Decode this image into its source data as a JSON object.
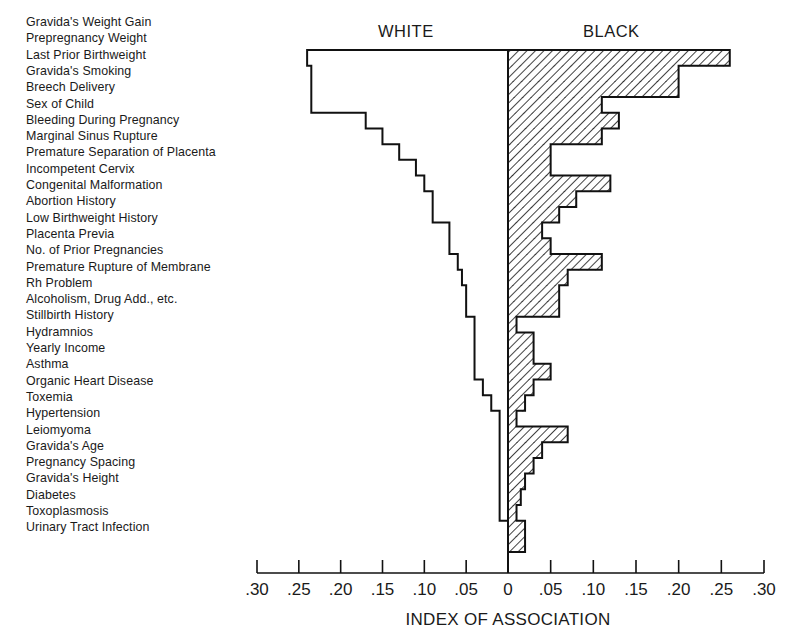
{
  "chart_data": {
    "type": "bar",
    "orientation": "horizontal-diverging",
    "xlabel": "INDEX OF ASSOCIATION",
    "ylabel": "",
    "xlim_left": [
      0.3,
      0
    ],
    "xlim_right": [
      0,
      0.3
    ],
    "x_tick_labels": [
      ".30",
      ".25",
      ".20",
      ".15",
      ".10",
      ".05",
      "0",
      ".05",
      ".10",
      ".15",
      ".20",
      ".25",
      ".30"
    ],
    "grid": false,
    "legend": "side titles above chart",
    "categories": [
      "Gravida's Weight Gain",
      "Prepregnancy Weight",
      "Last Prior Birthweight",
      "Gravida's Smoking",
      "Breech Delivery",
      "Sex of Child",
      "Bleeding During Pregnancy",
      "Marginal Sinus Rupture",
      "Premature Separation of Placenta",
      "Incompetent Cervix",
      "Congenital Malformation",
      "Abortion History",
      "Low Birthweight History",
      "Placenta Previa",
      "No. of Prior Pregnancies",
      "Premature Rupture of Membrane",
      "Rh Problem",
      "Alcoholism, Drug Add., etc.",
      "Stillbirth History",
      "Hydramnios",
      "Yearly Income",
      "Asthma",
      "Organic Heart Disease",
      "Toxemia",
      "Hypertension",
      "Leiomyoma",
      "Gravida's Age",
      "Pregnancy Spacing",
      "Gravida's Height",
      "Diabetes",
      "Toxoplasmosis",
      "Urinary Tract Infection"
    ],
    "series": [
      {
        "name": "WHITE",
        "side": "left",
        "style": "outline",
        "values": [
          0.24,
          0.235,
          0.235,
          0.235,
          0.17,
          0.15,
          0.13,
          0.11,
          0.1,
          0.09,
          0.09,
          0.07,
          0.07,
          0.06,
          0.055,
          0.05,
          0.05,
          0.04,
          0.04,
          0.04,
          0.04,
          0.03,
          0.02,
          0.01,
          0.01,
          0.01,
          0.01,
          0.01,
          0.01,
          0.01,
          0.0,
          0.0
        ]
      },
      {
        "name": "BLACK",
        "side": "right",
        "style": "hatched",
        "values": [
          0.26,
          0.2,
          0.2,
          0.11,
          0.13,
          0.11,
          0.05,
          0.05,
          0.12,
          0.08,
          0.06,
          0.04,
          0.05,
          0.11,
          0.07,
          0.06,
          0.06,
          0.01,
          0.03,
          0.03,
          0.05,
          0.03,
          0.02,
          0.01,
          0.07,
          0.04,
          0.03,
          0.02,
          0.015,
          0.01,
          0.02,
          0.02
        ]
      }
    ],
    "side_titles": {
      "left": "WHITE",
      "right": "BLACK"
    }
  }
}
